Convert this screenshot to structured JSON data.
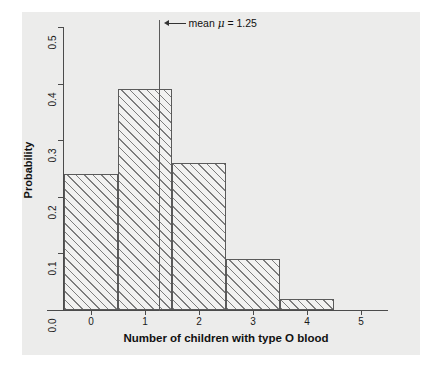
{
  "chart_data": {
    "type": "bar",
    "title": "",
    "subtitle": "",
    "xlabel": "Number of children with type O blood",
    "ylabel": "Probability",
    "categories": [
      "0",
      "1",
      "2",
      "3",
      "4",
      "5"
    ],
    "values": [
      0.24,
      0.39,
      0.26,
      0.09,
      0.02,
      0.0
    ],
    "xlim": [
      -0.5,
      5.5
    ],
    "ylim": [
      0.0,
      0.5
    ],
    "xticks": [
      "0",
      "1",
      "2",
      "3",
      "4",
      "5"
    ],
    "yticks": [
      "0.0",
      "0.1",
      "0.2",
      "0.3",
      "0.4",
      "0.5"
    ],
    "grid": false,
    "legend": "none",
    "bar_width": 1.0,
    "bar_style": "diagonal-hatch",
    "annotations": [
      {
        "name": "mean-marker",
        "text_prefix": "mean ",
        "symbol": "μ",
        "text_suffix": " = 1.25",
        "full_text": "mean μ = 1.25",
        "x_value": 1.25,
        "arrow": "left-arrow"
      }
    ]
  },
  "colors": {
    "panel_background": "#ececeb",
    "figure_background": "#ffffff",
    "axis": "#4b4b4b",
    "bar_edge": "#5a5a5a",
    "bar_fill": "#f2f2f1",
    "hatch": "#7d7d7d",
    "text": "#111111",
    "mean_line": "#5a5a5a"
  }
}
